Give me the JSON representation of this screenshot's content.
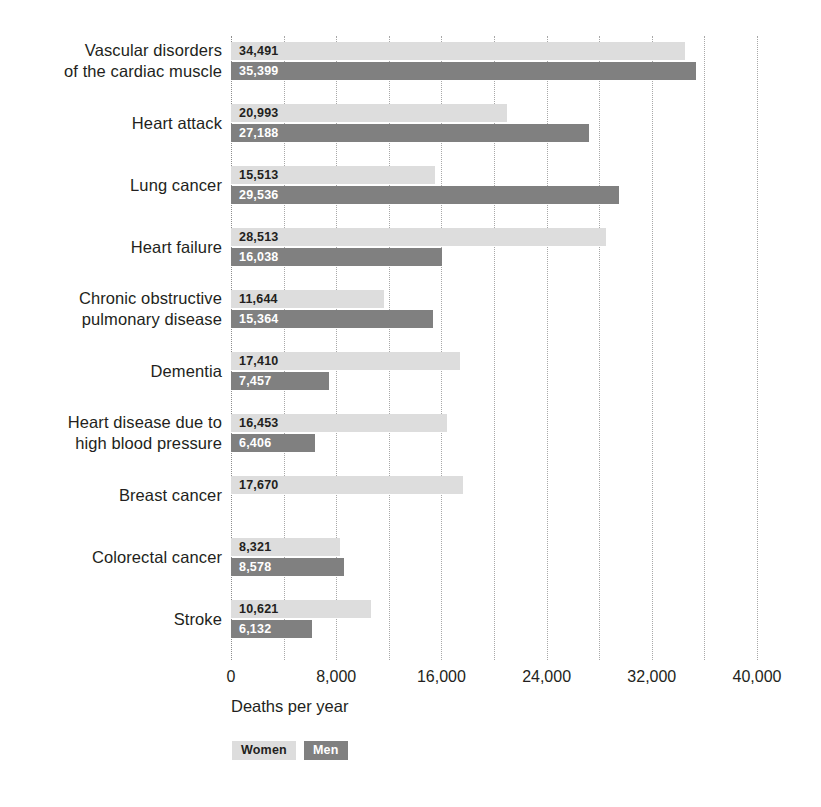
{
  "chart_data": {
    "type": "bar",
    "orientation": "horizontal",
    "title": "",
    "subtitle": "",
    "xlabel": "Deaths per year",
    "ylabel": "",
    "xlim": [
      0,
      40000
    ],
    "xticks": [
      0,
      8000,
      16000,
      24000,
      32000,
      40000
    ],
    "xtick_labels": [
      "0",
      "8,000",
      "16,000",
      "24,000",
      "32,000",
      "40,000"
    ],
    "minor_gridlines_step": 4000,
    "grid": true,
    "legend_position": "bottom-left",
    "categories": [
      "Vascular disorders\nof the cardiac muscle",
      "Heart attack",
      "Lung cancer",
      "Heart failure",
      "Chronic obstructive\npulmonary disease",
      "Dementia",
      "Heart disease due to\nhigh blood pressure",
      "Breast cancer",
      "Colorectal cancer",
      "Stroke"
    ],
    "series": [
      {
        "name": "Women",
        "color": "#dddddd",
        "label_color": "#231f20",
        "values": [
          34491,
          20993,
          15513,
          28513,
          11644,
          17410,
          16453,
          17670,
          8321,
          10621
        ],
        "value_labels": [
          "34,491",
          "20,993",
          "15,513",
          "28,513",
          "11,644",
          "17,410",
          "16,453",
          "17,670",
          "8,321",
          "10,621"
        ]
      },
      {
        "name": "Men",
        "color": "#808080",
        "label_color": "#ffffff",
        "values": [
          35399,
          27188,
          29536,
          16038,
          15364,
          7457,
          6406,
          null,
          8578,
          6132
        ],
        "value_labels": [
          "35,399",
          "27,188",
          "29,536",
          "16,038",
          "15,364",
          "7,457",
          "6,406",
          null,
          "8,578",
          "6,132"
        ]
      }
    ]
  },
  "legend": {
    "items": [
      {
        "label": "Women",
        "class": "women"
      },
      {
        "label": "Men",
        "class": "men"
      }
    ]
  }
}
